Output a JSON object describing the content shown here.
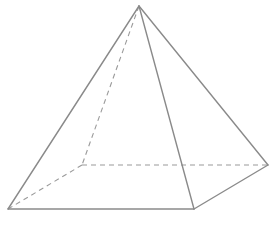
{
  "diagram": {
    "type": "square-pyramid",
    "colors": {
      "background": "#ffffff",
      "solid_edge": "#8a8a8a",
      "hidden_edge": "#9a9a9a"
    },
    "vertices": {
      "apex": [
        139,
        6
      ],
      "base_front_left": [
        8,
        209
      ],
      "base_front_right": [
        194,
        209
      ],
      "base_back_right": [
        268,
        165
      ],
      "base_back_left": [
        82,
        165
      ]
    },
    "solid_edges": [
      [
        "apex",
        "base_front_left"
      ],
      [
        "apex",
        "base_front_right"
      ],
      [
        "apex",
        "base_back_right"
      ],
      [
        "base_front_left",
        "base_front_right"
      ],
      [
        "base_front_right",
        "base_back_right"
      ]
    ],
    "hidden_edges": [
      [
        "apex",
        "base_back_left"
      ],
      [
        "base_back_left",
        "base_front_left"
      ],
      [
        "base_back_left",
        "base_back_right"
      ]
    ]
  }
}
